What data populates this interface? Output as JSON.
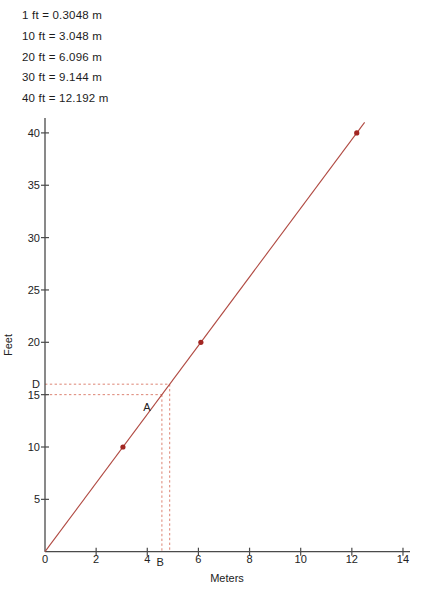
{
  "conversions": [
    "1 ft = 0.3048 m",
    "10 ft = 3.048 m",
    "20 ft = 6.096 m",
    "30 ft = 9.144 m",
    "40 ft = 12.192 m"
  ],
  "chart_data": {
    "type": "line",
    "title": "",
    "xlabel": "Meters",
    "ylabel": "Feet",
    "xlim": [
      0,
      14.3
    ],
    "ylim": [
      0,
      41.5
    ],
    "x_ticks": [
      0,
      2,
      4,
      6,
      8,
      10,
      12,
      14
    ],
    "y_ticks": [
      5,
      10,
      15,
      20,
      25,
      30,
      35,
      40
    ],
    "grid": false,
    "legend": "none",
    "line_series": {
      "name": "feet-vs-meters",
      "slope_ft_per_m": 3.2808,
      "x_start_m": 0,
      "x_end_m": 12.5
    },
    "points": [
      {
        "m": 3.048,
        "ft": 10
      },
      {
        "m": 6.096,
        "ft": 20
      },
      {
        "m": 12.192,
        "ft": 40
      }
    ],
    "guides": [
      {
        "ft": 16,
        "m": 4.8768,
        "label": "D"
      },
      {
        "ft": 15,
        "m": 4.572,
        "label": ""
      }
    ],
    "annotations": [
      {
        "label": "A",
        "m": 3.99,
        "ft": 13.8
      },
      {
        "label": "B",
        "m": 4.5,
        "ft": -1.0
      }
    ],
    "colors": {
      "line": "#b04a42",
      "point": "#a22622",
      "guide": "#dd8474",
      "axis": "#4a4a4a",
      "text": "#222222"
    }
  }
}
